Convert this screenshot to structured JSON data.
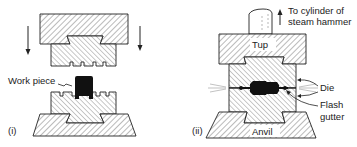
{
  "figure": {
    "panel_i": {
      "label": "(i)",
      "work_piece_label": "Work piece"
    },
    "panel_ii": {
      "label": "(ii)",
      "cylinder_label_line1": "To cylinder of",
      "cylinder_label_line2": "steam hammer",
      "tup_label": "Tup",
      "die_label": "Die",
      "flash_gutter_line1": "Flash",
      "flash_gutter_line2": "gutter",
      "anvil_label": "Anvil"
    }
  },
  "colors": {
    "ink": "#222222",
    "hatch": "#555555",
    "workpiece": "#111111",
    "background": "#ffffff"
  }
}
